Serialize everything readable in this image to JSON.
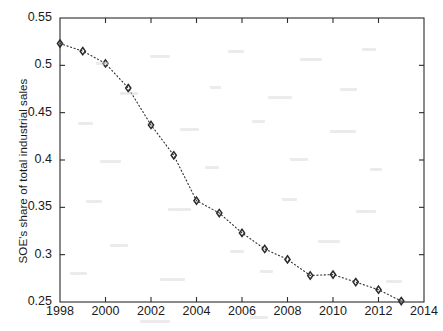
{
  "chart_data": {
    "type": "line",
    "title": "",
    "subtitle": "",
    "xlabel": "",
    "ylabel": "SOE's share of total industrial sales",
    "xlim": [
      1998,
      2014
    ],
    "ylim": [
      0.25,
      0.55
    ],
    "xticks": [
      1998,
      2000,
      2002,
      2004,
      2006,
      2008,
      2010,
      2012,
      2014
    ],
    "xtick_labels": [
      "1998",
      "2000",
      "2002",
      "2004",
      "2006",
      "2008",
      "2010",
      "2012",
      "2014"
    ],
    "yticks": [
      0.25,
      0.3,
      0.35,
      0.4,
      0.45,
      0.5,
      0.55
    ],
    "ytick_labels": [
      "0.25",
      "0.3",
      "0.35",
      "0.4",
      "0.45",
      "0.5",
      "0.55"
    ],
    "grid": false,
    "legend": null,
    "marker": "diamond",
    "line_style": "dotted",
    "line_color": "#2b2b2b",
    "marker_color": "#2b2b2b",
    "x": [
      1998,
      1999,
      2000,
      2001,
      2002,
      2003,
      2004,
      2005,
      2006,
      2007,
      2008,
      2009,
      2010,
      2011,
      2012,
      2013
    ],
    "values": [
      0.523,
      0.515,
      0.502,
      0.476,
      0.437,
      0.405,
      0.357,
      0.344,
      0.323,
      0.306,
      0.295,
      0.278,
      0.279,
      0.271,
      0.263,
      0.251
    ],
    "series": [
      {
        "name": "SOE's share of total industrial sales",
        "values": [
          0.523,
          0.515,
          0.502,
          0.476,
          0.437,
          0.405,
          0.357,
          0.344,
          0.323,
          0.306,
          0.295,
          0.278,
          0.279,
          0.271,
          0.263,
          0.251
        ]
      }
    ]
  },
  "axes": {
    "box": true,
    "tick_direction": "in",
    "axis_color": "#2b2b2b",
    "background": "#ffffff"
  }
}
